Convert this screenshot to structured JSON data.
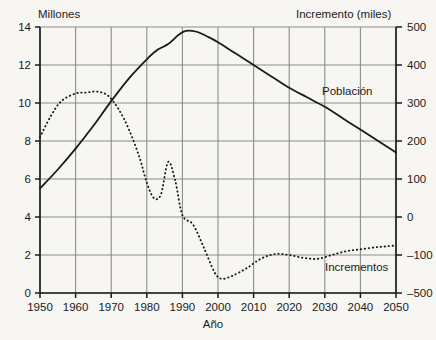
{
  "chart_data": {
    "type": "line",
    "title": "",
    "xlabel": "Año",
    "ylabel_left": "Millones",
    "ylabel_right": "Incremento (miles)",
    "grid": true,
    "legend_position": "inline-annotations",
    "xlim": [
      1950,
      2050
    ],
    "xticks": [
      "1950",
      "1960",
      "1970",
      "1980",
      "1990",
      "2000",
      "2010",
      "2020",
      "2030",
      "2040",
      "2050"
    ],
    "ylim_left": [
      0,
      14
    ],
    "yticks_left": [
      "0",
      "2",
      "4",
      "6",
      "8",
      "10",
      "12",
      "14"
    ],
    "ylim_right": [
      -200,
      500
    ],
    "yticks_right": [
      "500",
      "400",
      "300",
      "200",
      "100",
      "0",
      "-100",
      "-500"
    ],
    "yticks_right_values": [
      500,
      400,
      300,
      200,
      100,
      0,
      -100,
      -200
    ],
    "series": [
      {
        "name": "Población",
        "axis": "left",
        "style": "solid",
        "color": "#1a1a1a",
        "x": [
          1950,
          1955,
          1960,
          1965,
          1970,
          1975,
          1980,
          1983,
          1986,
          1989,
          1991,
          1994,
          1997,
          2000,
          2005,
          2010,
          2015,
          2020,
          2025,
          2030,
          2035,
          2040,
          2045,
          2050
        ],
        "values": [
          5.5,
          6.5,
          7.6,
          8.8,
          10.1,
          11.3,
          12.3,
          12.8,
          13.1,
          13.6,
          13.8,
          13.75,
          13.5,
          13.2,
          12.6,
          12.0,
          11.4,
          10.8,
          10.3,
          9.8,
          9.2,
          8.6,
          8.0,
          7.4
        ]
      },
      {
        "name": "Incrementos",
        "axis": "right",
        "style": "dashed",
        "color": "#1a1a1a",
        "x": [
          1950,
          1953,
          1956,
          1960,
          1963,
          1966,
          1969,
          1972,
          1975,
          1978,
          1980,
          1982,
          1984,
          1986,
          1988,
          1990,
          1993,
          1996,
          1999,
          2001,
          2004,
          2008,
          2012,
          2016,
          2020,
          2024,
          2028,
          2032,
          2036,
          2040,
          2044,
          2047,
          2050
        ],
        "values_left_scale": [
          8.2,
          9.3,
          10.1,
          10.5,
          10.55,
          10.6,
          10.4,
          9.7,
          8.6,
          7.1,
          5.8,
          5.0,
          5.2,
          6.9,
          5.9,
          4.1,
          3.6,
          2.4,
          1.1,
          0.75,
          0.9,
          1.3,
          1.8,
          2.05,
          2.0,
          1.85,
          1.8,
          2.0,
          2.2,
          2.3,
          2.4,
          2.45,
          2.5
        ],
        "values_right_scale": [
          210,
          265,
          305,
          325,
          328,
          330,
          320,
          285,
          230,
          155,
          90,
          50,
          60,
          145,
          95,
          5,
          -20,
          -80,
          -145,
          -163,
          -155,
          -135,
          -110,
          -98,
          -100,
          -108,
          -110,
          -100,
          -90,
          -85,
          -80,
          -78,
          -75
        ]
      }
    ],
    "annotations": [
      {
        "text": "Población",
        "x": 2027,
        "y_left": 11.6
      },
      {
        "text": "Incrementos",
        "x": 2032,
        "y_left": 1.25
      }
    ]
  },
  "colors": {
    "background": "#f7f6f3",
    "grid": "#8c8c8c",
    "axis": "#1a1a1a",
    "series": "#1a1a1a"
  }
}
